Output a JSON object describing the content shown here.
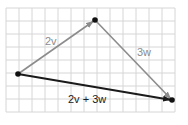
{
  "diagram": {
    "type": "vector-addition-triangle",
    "grid": {
      "cell_size": 13,
      "origin_x": 6,
      "origin_y": 8,
      "cols": 13,
      "rows": 8,
      "color": "#d6d6d6"
    },
    "points": {
      "tail": {
        "x": 18,
        "y": 74
      },
      "apex": {
        "x": 95,
        "y": 20
      },
      "head": {
        "x": 172,
        "y": 100
      }
    },
    "vectors": [
      {
        "id": "2v",
        "label": "2v",
        "from": "tail",
        "to": "apex",
        "color": "#8c8c8c"
      },
      {
        "id": "3w",
        "label": "3w",
        "from": "apex",
        "to": "head",
        "color": "#8c8c8c"
      },
      {
        "id": "sum",
        "label": "2v + 3w",
        "from": "tail",
        "to": "head",
        "color": "#1a1a1a"
      }
    ],
    "labels": {
      "v2": "2v",
      "w3": "3w",
      "sum": "2v + 3w"
    }
  }
}
